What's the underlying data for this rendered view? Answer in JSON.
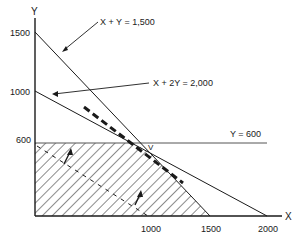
{
  "diagram": {
    "type": "linear-programming-feasible-region",
    "axes": {
      "x_label": "X",
      "y_label": "Y",
      "x_ticks": [
        "1000",
        "1500",
        "2000"
      ],
      "y_ticks": [
        "1500",
        "1000",
        "600"
      ]
    },
    "constraints": [
      {
        "label": "X + Y = 1,500",
        "x_intercept": 1500,
        "y_intercept": 1500
      },
      {
        "label": "X + 2Y = 2,000",
        "x_intercept": 2000,
        "y_intercept": 1000
      },
      {
        "label": "Y = 600",
        "y_value": 600
      }
    ],
    "optimal_vertex_label": "V",
    "feasible_region": "hatched",
    "colors": {
      "line": "#1a1a1a",
      "hatch": "#1a1a1a",
      "background": "#ffffff"
    }
  }
}
